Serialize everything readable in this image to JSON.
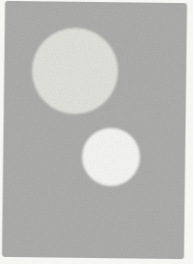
{
  "figure": {
    "page_background_color": "#f6f6f3",
    "card": {
      "color": "#b3b3b1",
      "x": 3.5,
      "y": 2,
      "width": 182,
      "height": 256,
      "corner_radius": 3,
      "transform": "rotate(0.7 94.5 130)"
    },
    "circles": {
      "large": {
        "cx": 75,
        "cy": 71,
        "r": 43,
        "color": "#e9e9e4"
      },
      "small": {
        "cx": 111,
        "cy": 157,
        "r": 29,
        "color": "#fdfdfc"
      }
    }
  }
}
